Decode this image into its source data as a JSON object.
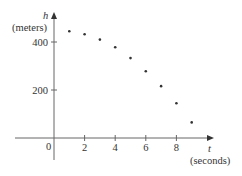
{
  "chart_data": {
    "type": "scatter",
    "title": "",
    "xlabel": "t (seconds)",
    "ylabel": "h (meters)",
    "x_axis": {
      "symbol": "t",
      "unit": "(seconds)",
      "ticks": [
        2,
        4,
        6,
        8
      ],
      "tick_labels": [
        "2",
        "4",
        "6",
        "8"
      ]
    },
    "y_axis": {
      "symbol": "h",
      "unit": "(meters)",
      "ticks": [
        200,
        400
      ],
      "tick_labels": [
        "200",
        "400"
      ]
    },
    "origin_label": "0",
    "xlim": [
      -2.5,
      10
    ],
    "ylim": [
      -90,
      525
    ],
    "grid": false,
    "legend": null,
    "x": [
      1,
      2,
      3,
      4,
      5,
      6,
      7,
      8,
      9
    ],
    "y": [
      445,
      432,
      410,
      378,
      333,
      278,
      216,
      145,
      65
    ],
    "series": [
      {
        "name": "h(t)",
        "x": [
          1,
          2,
          3,
          4,
          5,
          6,
          7,
          8,
          9
        ],
        "values": [
          445,
          432,
          410,
          378,
          333,
          278,
          216,
          145,
          65
        ]
      }
    ],
    "colors": {
      "axis": "#555555",
      "point": "#333333"
    }
  }
}
